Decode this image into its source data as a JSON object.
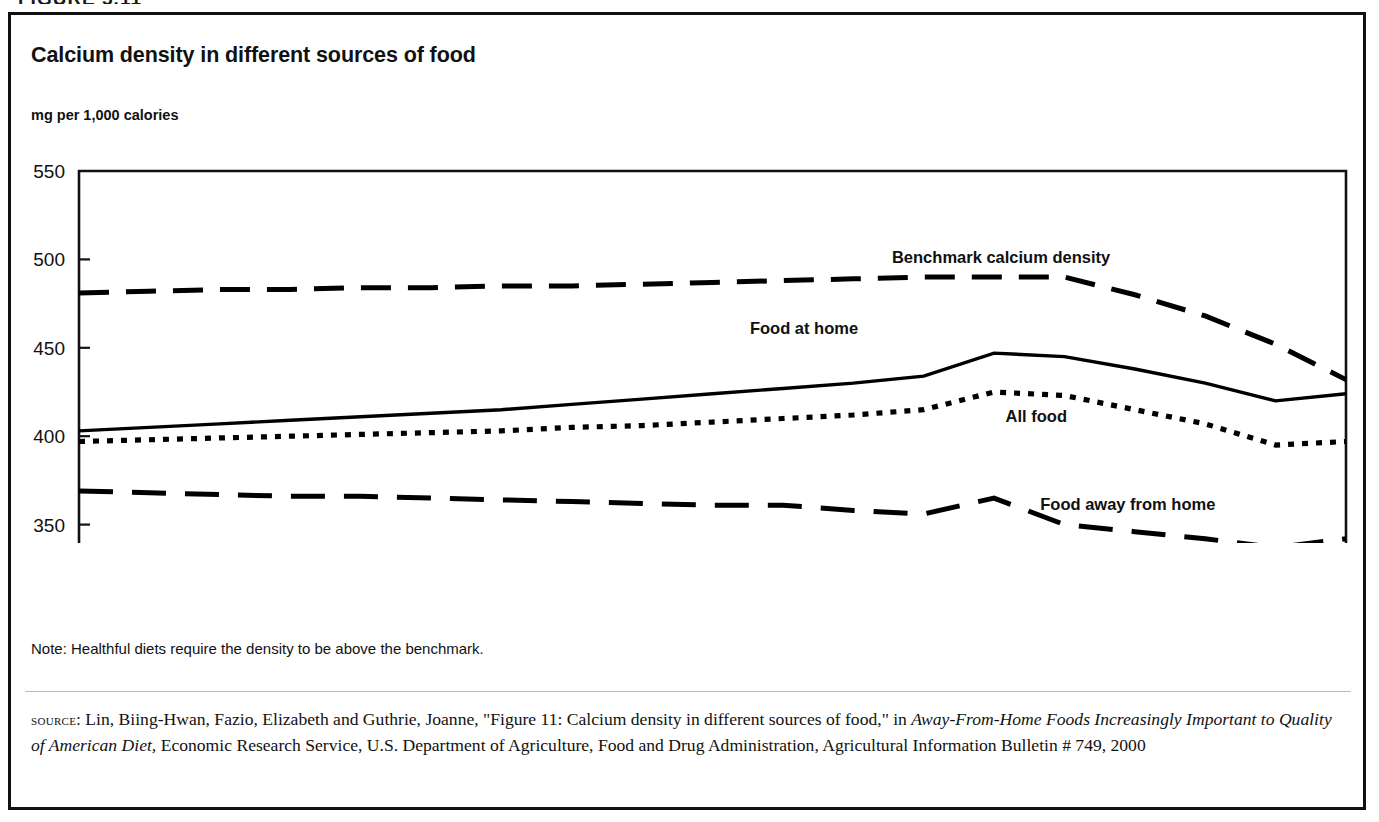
{
  "clipped_heading": "FIGURE 5.11",
  "figure": {
    "title": "Calcium density in different sources of food",
    "axis_units": "mg per 1,000 calories",
    "note": "Note: Healthful diets require the density to be above the benchmark.",
    "source": {
      "label": "source:",
      "part1": " Lin, Biing-Hwan, Fazio, Elizabeth and Guthrie, Joanne, \"Figure 11: Calcium density in different sources of food,\" in ",
      "italic1": "Away-From-Home Foods Increasingly Important to Quality of American Diet,",
      "part2": " Economic Research Service, U.S. Department of Agriculture, Food and Drug Administration, Agricultural Information Bulletin # 749, 2000"
    }
  },
  "chart_data": {
    "type": "line",
    "title": "Calcium density in different sources of food",
    "xlabel": "Year",
    "ylabel": "mg per 1,000 calories",
    "ylim": [
      300,
      550
    ],
    "yticks": [
      300,
      350,
      400,
      450,
      500,
      550
    ],
    "xlim": [
      77,
      95
    ],
    "x": [
      77,
      78,
      79,
      80,
      81,
      82,
      83,
      84,
      85,
      86,
      87,
      88,
      89,
      90,
      91,
      92,
      93,
      94,
      95
    ],
    "xtick_labels": [
      "77",
      "",
      "",
      "",
      "",
      "",
      "",
      "",
      "",
      "",
      "87",
      "",
      "89",
      "90",
      "91",
      "",
      "",
      "94",
      "95"
    ],
    "grid": false,
    "legend_position": "inline-labels",
    "series": [
      {
        "name": "Benchmark calcium density",
        "style": "dashed",
        "label_x": 90.1,
        "label_y": 498,
        "values": [
          481,
          482,
          483,
          483,
          484,
          484,
          485,
          485,
          486,
          487,
          488,
          489,
          490,
          490,
          490,
          480,
          468,
          452,
          432
        ]
      },
      {
        "name": "Food at home",
        "style": "solid",
        "label_x": 87.3,
        "label_y": 458,
        "values": [
          403,
          405,
          407,
          409,
          411,
          413,
          415,
          418,
          421,
          424,
          427,
          430,
          434,
          447,
          445,
          438,
          430,
          420,
          424
        ]
      },
      {
        "name": "All food",
        "style": "dotted",
        "label_x": 90.6,
        "label_y": 408,
        "values": [
          397,
          398,
          399,
          400,
          401,
          402,
          403,
          405,
          406,
          408,
          410,
          412,
          415,
          425,
          423,
          415,
          407,
          395,
          397
        ]
      },
      {
        "name": "Food away from home",
        "style": "longdash",
        "label_x": 91.9,
        "label_y": 358,
        "values": [
          369,
          368,
          367,
          366,
          366,
          365,
          364,
          363,
          362,
          361,
          361,
          358,
          356,
          365,
          350,
          346,
          342,
          337,
          342
        ]
      }
    ]
  }
}
